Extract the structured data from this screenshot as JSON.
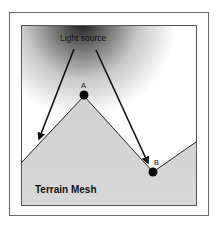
{
  "diagram": {
    "light_source_label": "Light source",
    "point_a_label": "A",
    "point_b_label": "B",
    "terrain_label": "Terrain Mesh",
    "colors": {
      "frame": "#555555",
      "terrain_fill": "#d4d4d4",
      "sky_dark": "#1a1a1a",
      "sky_light": "#ffffff",
      "arrow": "#111111",
      "point": "#0a0a0a"
    }
  }
}
